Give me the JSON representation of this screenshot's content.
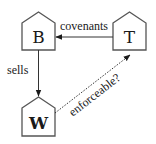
{
  "diagram": {
    "nodes": [
      {
        "id": "B",
        "label": "B",
        "x": 22,
        "y": 12,
        "w": 33,
        "roof": 11,
        "h": 38
      },
      {
        "id": "T",
        "label": "T",
        "x": 113,
        "y": 12,
        "w": 33,
        "roof": 11,
        "h": 38
      },
      {
        "id": "W",
        "label": "W",
        "x": 22,
        "y": 97,
        "w": 33,
        "roof": 11,
        "h": 39
      }
    ],
    "edges": [
      {
        "from": "T",
        "to": "B",
        "label": "covenants",
        "style": "solid"
      },
      {
        "from": "B",
        "to": "W",
        "label": "sells",
        "style": "solid"
      },
      {
        "from": "W",
        "to": "T",
        "label": "enforceable?",
        "style": "dotted"
      }
    ]
  },
  "labels": {
    "node_b": "B",
    "node_t": "T",
    "node_w": "W",
    "edge_covenants": "covenants",
    "edge_sells": "sells",
    "edge_enforceable": "enforceable?"
  },
  "colors": {
    "stroke": "#555555",
    "text": "#1a1a1a",
    "background": "#ffffff"
  }
}
